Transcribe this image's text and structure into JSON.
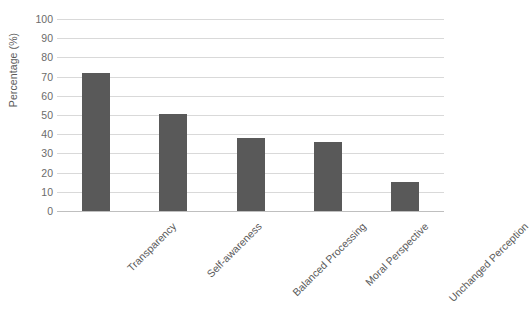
{
  "chart_data": {
    "type": "bar",
    "title": "",
    "subtitle": "",
    "xlabel": "",
    "ylabel": "Percentage (%)",
    "categories": [
      "Transparency",
      "Self-awareness",
      "Balanced Processing",
      "Moral Perspective",
      "Unchanged Perception"
    ],
    "values": [
      72,
      50.5,
      38,
      36,
      15
    ],
    "ylim": [
      0,
      100
    ],
    "ytick_values": [
      0,
      10,
      20,
      30,
      40,
      50,
      60,
      70,
      80,
      90,
      100
    ],
    "ytick_labels": [
      "0",
      "10",
      "20",
      "30",
      "40",
      "50",
      "60",
      "70",
      "80",
      "90",
      "100"
    ],
    "grid": "horizontal",
    "legend": "none",
    "series": [
      {
        "name": "Percentage",
        "values": [
          72,
          50.5,
          38,
          36,
          15
        ],
        "color": "#595959"
      }
    ],
    "colors": {
      "bar": "#595959",
      "gridline": "#d9d9d9",
      "baseline": "#bfbfbf",
      "tick_text": "#6b6b6b",
      "axis_title": "#5a5a5a",
      "background": "#ffffff"
    }
  }
}
